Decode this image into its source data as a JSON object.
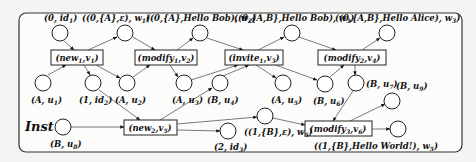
{
  "diagram": {
    "type": "petri-net",
    "label": "Inst",
    "places": [
      {
        "id": "p_id1",
        "label": "(0, id1)",
        "x": 60,
        "y": 33,
        "lx": 44,
        "ly": 19
      },
      {
        "id": "p_w1",
        "label": "((0,{A},ε), w1)",
        "x": 125,
        "y": 33,
        "lx": 82,
        "ly": 19
      },
      {
        "id": "p_w2",
        "label": "((0,{A},Hello Bob), w2)",
        "x": 200,
        "y": 33,
        "lx": 148,
        "ly": 19
      },
      {
        "id": "p_w3",
        "label": "((0,{A,B},Hello Bob), w3)",
        "x": 292,
        "y": 33,
        "lx": 238,
        "ly": 19
      },
      {
        "id": "p_w3b",
        "label": "((0,{A,B},Hello Alice), w3)",
        "x": 387,
        "y": 33,
        "lx": 336,
        "ly": 19
      },
      {
        "id": "p_u1",
        "label": "(A, u1)",
        "x": 43,
        "y": 83,
        "lx": 30,
        "ly": 103
      },
      {
        "id": "p_id2",
        "label": "(1, id2)",
        "x": 93,
        "y": 83,
        "lx": 79,
        "ly": 103
      },
      {
        "id": "p_u2",
        "label": "(A, u2)",
        "x": 127,
        "y": 83,
        "lx": 115,
        "ly": 103
      },
      {
        "id": "p_u3",
        "label": "(A, u3)",
        "x": 184,
        "y": 83,
        "lx": 171,
        "ly": 103
      },
      {
        "id": "p_u4",
        "label": "(B, u4)",
        "x": 220,
        "y": 83,
        "lx": 207,
        "ly": 103
      },
      {
        "id": "p_u5",
        "label": "(A, u5)",
        "x": 283,
        "y": 83,
        "lx": 270,
        "ly": 103
      },
      {
        "id": "p_u6",
        "label": "(B, u6)",
        "x": 325,
        "y": 84,
        "lx": 312,
        "ly": 104
      },
      {
        "id": "p_u7",
        "label": "(B, u7)",
        "x": 356,
        "y": 83,
        "lx": 366,
        "ly": 86
      },
      {
        "id": "p_u9",
        "label": "(B, u9)",
        "x": 392,
        "y": 101,
        "lx": 395,
        "ly": 87
      },
      {
        "id": "p_u8",
        "label": "(B, u8)",
        "x": 63,
        "y": 127,
        "lx": 50,
        "ly": 147
      },
      {
        "id": "p_eps",
        "label": "((1,{B},ε), w5)",
        "x": 265,
        "y": 116,
        "lx": 245,
        "ly": 136
      },
      {
        "id": "p_id3",
        "label": "(2, id3)",
        "x": 228,
        "y": 131,
        "lx": 215,
        "ly": 150
      },
      {
        "id": "p_hw",
        "label": "((1,{B},Hello World!), w5)",
        "x": 398,
        "y": 129,
        "lx": 320,
        "ly": 149
      }
    ],
    "transitions": [
      {
        "id": "t_new1",
        "label": "(new1,v1)",
        "x": 51,
        "y": 50,
        "w": 52,
        "h": 15
      },
      {
        "id": "t_mod1",
        "label": "(modify1,v2)",
        "x": 135,
        "y": 50,
        "w": 62,
        "h": 15
      },
      {
        "id": "t_inv1",
        "label": "(invite1,v3)",
        "x": 225,
        "y": 50,
        "w": 58,
        "h": 15
      },
      {
        "id": "t_mod2",
        "label": "(modify2,v4)",
        "x": 318,
        "y": 50,
        "w": 68,
        "h": 15
      },
      {
        "id": "t_new2",
        "label": "(new2,v5)",
        "x": 124,
        "y": 120,
        "w": 53,
        "h": 15
      },
      {
        "id": "t_mod3",
        "label": "(modify3,v6)",
        "x": 305,
        "y": 121,
        "w": 67,
        "h": 15
      }
    ]
  },
  "text": {
    "inst": "Inst",
    "new1": "(new",
    "new1_sub": "1",
    "new1_tail": ",v",
    "new1_vsub": "1",
    "new1_end": ")",
    "mod1": "(modify",
    "mod1_sub": "1",
    "mod1_tail": ",v",
    "mod1_vsub": "2",
    "mod1_end": ")",
    "inv1": "(invite",
    "inv1_sub": "1",
    "inv1_tail": ",v",
    "inv1_vsub": "3",
    "inv1_end": ")",
    "mod2": "(modify",
    "mod2_sub": "2",
    "mod2_tail": ",v",
    "mod2_vsub": "4",
    "mod2_end": ")",
    "new2": "(new",
    "new2_sub": "2",
    "new2_tail": ",v",
    "new2_vsub": "5",
    "new2_end": ")",
    "mod3": "(modify",
    "mod3_sub": "3",
    "mod3_tail": ",v",
    "mod3_vsub": "6",
    "mod3_end": ")",
    "p_id1": "(0, id",
    "p_id1_sub": "1",
    "p_id1_end": ")",
    "p_w1": "((0,{A},ε), w",
    "p_w1_sub": "1",
    "p_w1_end": ")",
    "p_w2a": "((0,{A},",
    "p_w2b": "Hello Bob",
    "p_w2c": "), w",
    "p_w2_sub": "2",
    "p_w2_end": ")",
    "p_w3a": "((0,{A,B},",
    "p_w3b": "Hello Bob",
    "p_w3c": "), w",
    "p_w3_sub": "3",
    "p_w3_end": ")",
    "p_w4a": "((0,{A,B},",
    "p_w4b": "Hello Alice",
    "p_w4c": "), w",
    "p_w4_sub": "3",
    "p_w4_end": ")",
    "p_u1": "(A, u",
    "p_u1_sub": "1",
    "p_u1_end": ")",
    "p_id2": "(1, id",
    "p_id2_sub": "2",
    "p_id2_end": ")",
    "p_u2": "(A, u",
    "p_u2_sub": "2",
    "p_u2_end": ")",
    "p_u3": "(A, u",
    "p_u3_sub": "3",
    "p_u3_end": ")",
    "p_u4": "(B, u",
    "p_u4_sub": "4",
    "p_u4_end": ")",
    "p_u5": "(A, u",
    "p_u5_sub": "5",
    "p_u5_end": ")",
    "p_u6": "(B, u",
    "p_u6_sub": "6",
    "p_u6_end": ")",
    "p_u7": "(B, u",
    "p_u7_sub": "7",
    "p_u7_end": ")",
    "p_u9": "(B, u",
    "p_u9_sub": "9",
    "p_u9_end": ")",
    "p_u8": "(B, u",
    "p_u8_sub": "8",
    "p_u8_end": ")",
    "p_eps": "((1,{B},ε), w",
    "p_eps_sub": "5",
    "p_eps_end": ")",
    "p_id3": "(2, id",
    "p_id3_sub": "3",
    "p_id3_end": ")",
    "p_hw_a": "((1,{B},",
    "p_hw_b": "Hello World!",
    "p_hw_c": "), w",
    "p_hw_sub": "5",
    "p_hw_end": ")"
  }
}
